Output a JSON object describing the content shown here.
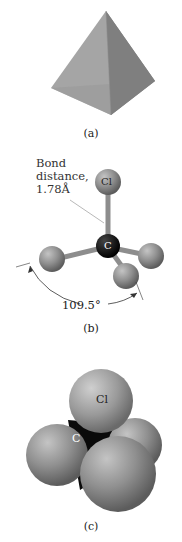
{
  "figure": {
    "panel_a": {
      "caption": "(a)",
      "shape": "tetrahedron"
    },
    "panel_b": {
      "caption": "(b)",
      "bond_label_line1": "Bond",
      "bond_label_line2": "distance,",
      "bond_label_line3": "1.78Å",
      "angle_label": "109.5°",
      "atom_top": "Cl",
      "atom_center": "C"
    },
    "panel_c": {
      "caption": "(c)",
      "atom_top": "Cl",
      "atom_center": "C"
    },
    "colors": {
      "sphere": "#8a8a8a",
      "carbon": "#111111",
      "tetra_light": "#a9a9a9",
      "tetra_dark": "#7d7d7d"
    }
  }
}
